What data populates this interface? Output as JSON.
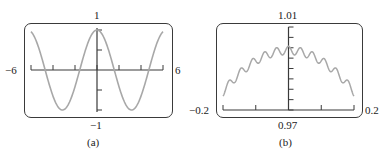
{
  "chart_data": [
    {
      "type": "line",
      "panel": "(a)",
      "function_shape": "cosine",
      "xlim": [
        -6,
        6
      ],
      "ylim": [
        -1,
        1
      ],
      "x_tick_labels": {
        "min": "-6",
        "max": "6"
      },
      "y_tick_labels": {
        "max": "1",
        "min": "-1"
      },
      "x_ticks": [
        -6,
        -4,
        -2,
        0,
        2,
        4,
        6
      ],
      "y_ticks": [
        -1,
        -0.5,
        0,
        0.5,
        1
      ],
      "x": [
        -6,
        -5,
        -4,
        -3.14,
        -2,
        -1,
        0,
        1,
        2,
        3.14,
        4,
        5,
        6
      ],
      "y": [
        0.96,
        0.28,
        -0.65,
        -1,
        -0.42,
        0.54,
        1,
        0.54,
        -0.42,
        -1,
        -0.65,
        0.28,
        0.96
      ],
      "caption": "(a)",
      "grid": false
    },
    {
      "type": "line",
      "panel": "(b)",
      "function_shape": "cosine with small high-frequency oscillation",
      "xlim": [
        -0.2,
        0.2
      ],
      "ylim": [
        0.97,
        1.01
      ],
      "x_tick_labels": {
        "min": "-0.2",
        "max": "0.2"
      },
      "y_tick_labels": {
        "max": "1.01",
        "min": "0.97"
      },
      "x_ticks": [
        -0.2,
        -0.1,
        0,
        0.1,
        0.2
      ],
      "y_ticks": [
        0.97,
        0.975,
        0.98,
        0.985,
        0.99,
        0.995,
        1.0,
        1.005,
        1.01
      ],
      "x": [
        -0.2,
        -0.15,
        -0.1,
        -0.05,
        0,
        0.05,
        0.1,
        0.15,
        0.2
      ],
      "y_envelope_mid": [
        0.98,
        0.989,
        0.995,
        0.999,
        1.0,
        0.999,
        0.995,
        0.989,
        0.98
      ],
      "oscillation_amplitude": 0.002,
      "oscillation_peaks": 11,
      "caption": "(b)",
      "grid": false
    }
  ],
  "panels": {
    "a": {
      "xmin": "−6",
      "xmax": "6",
      "ymax": "1",
      "ymin": "−1",
      "caption": "(a)"
    },
    "b": {
      "xmin": "−0.2",
      "xmax": "0.2",
      "ymax": "1.01",
      "ymin": "0.97",
      "caption": "(b)"
    }
  },
  "colors": {
    "curve": "#a8a8a8",
    "axis": "#3a3a3a",
    "frame": "#3a3a3a"
  }
}
